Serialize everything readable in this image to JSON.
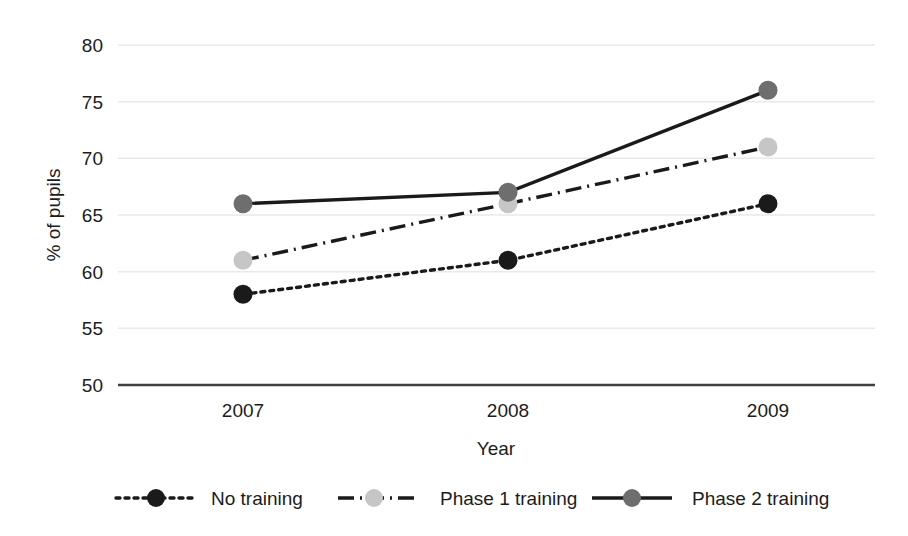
{
  "chart_data": {
    "type": "line",
    "title": "",
    "xlabel": "Year",
    "ylabel": "% of pupils",
    "categories": [
      "2007",
      "2008",
      "2009"
    ],
    "x": [
      2007,
      2008,
      2009
    ],
    "ylim": [
      50,
      80
    ],
    "yticks": [
      50,
      55,
      60,
      65,
      70,
      75,
      80
    ],
    "ytick_labels": [
      "50",
      "55",
      "60",
      "65",
      "70",
      "75",
      "80"
    ],
    "grid": "horizontal",
    "legend_position": "bottom",
    "series": [
      {
        "name": "No training",
        "values": [
          58,
          61,
          66
        ],
        "line_style": "dotted",
        "color": "#1a1a1a",
        "marker_color": "#1a1a1a"
      },
      {
        "name": "Phase 1 training",
        "values": [
          61,
          66,
          71
        ],
        "line_style": "dash-dot",
        "color": "#1a1a1a",
        "marker_color": "#c6c6c6"
      },
      {
        "name": "Phase 2 training",
        "values": [
          66,
          67,
          76
        ],
        "line_style": "solid",
        "color": "#1a1a1a",
        "marker_color": "#6e6e6e"
      }
    ]
  },
  "axes": {
    "y_title": "% of pupils",
    "x_title": "Year",
    "y_labels": [
      "80",
      "75",
      "70",
      "65",
      "60",
      "55",
      "50"
    ],
    "x_labels": [
      "2007",
      "2008",
      "2009"
    ]
  },
  "legend": {
    "items": [
      {
        "label": "No training"
      },
      {
        "label": "Phase 1 training"
      },
      {
        "label": "Phase 2 training"
      }
    ]
  },
  "colors": {
    "gridline": "#e9e9e9",
    "axis": "#3f3f3f",
    "text": "#1c1c1c",
    "series_no_training": "#1a1a1a",
    "series_phase1": "#c6c6c6",
    "series_phase2": "#6e6e6e"
  }
}
